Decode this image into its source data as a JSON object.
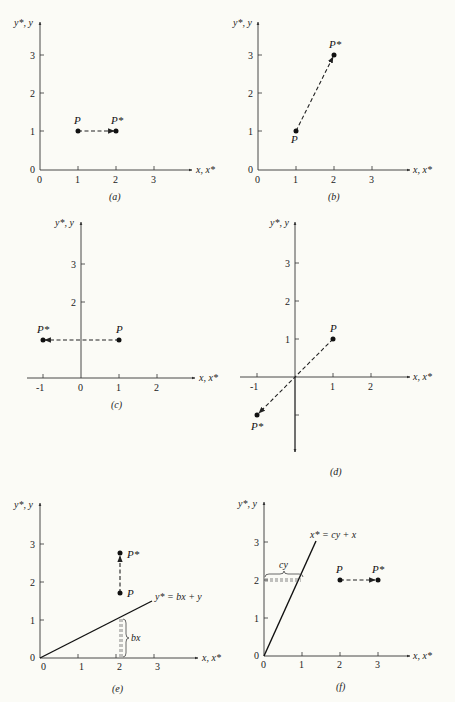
{
  "figure": {
    "panels": [
      {
        "id": "a",
        "caption": "(a)",
        "x_axis_label": "x, x*",
        "y_axis_label": "y*, y",
        "x_ticks": [
          "0",
          "1",
          "2",
          "3"
        ],
        "y_ticks": [
          "0",
          "1",
          "2",
          "3"
        ],
        "P": [
          1,
          1
        ],
        "P_star": [
          2,
          1
        ],
        "P_label": "P",
        "P_star_label": "P*"
      },
      {
        "id": "b",
        "caption": "(b)",
        "x_axis_label": "x, x*",
        "y_axis_label": "y*, y",
        "x_ticks": [
          "0",
          "1",
          "2",
          "3"
        ],
        "y_ticks": [
          "0",
          "1",
          "2",
          "3"
        ],
        "P": [
          1,
          1
        ],
        "P_star": [
          2,
          3
        ],
        "P_label": "P",
        "P_star_label": "P*"
      },
      {
        "id": "c",
        "caption": "(c)",
        "x_axis_label": "x, x*",
        "y_axis_label": "y*, y",
        "x_ticks": [
          "-1",
          "0",
          "1",
          "2"
        ],
        "y_ticks": [
          "2",
          "3"
        ],
        "P": [
          1,
          1
        ],
        "P_star": [
          -1,
          1
        ],
        "P_label": "P",
        "P_star_label": "P*"
      },
      {
        "id": "d",
        "caption": "(d)",
        "x_axis_label": "x, x*",
        "y_axis_label": "y*, y",
        "x_ticks": [
          "-1",
          "1",
          "2"
        ],
        "y_ticks": [
          "1",
          "2",
          "3"
        ],
        "P": [
          1,
          1
        ],
        "P_star": [
          -1,
          -1
        ],
        "P_label": "P",
        "P_star_label": "P*"
      },
      {
        "id": "e",
        "caption": "(e)",
        "x_axis_label": "x, x*",
        "y_axis_label": "y*, y",
        "x_ticks": [
          "0",
          "1",
          "2",
          "3"
        ],
        "y_ticks": [
          "0",
          "1",
          "2",
          "3"
        ],
        "P": [
          2,
          1.6
        ],
        "P_star": [
          2,
          2.6
        ],
        "P_label": "P",
        "P_star_label": "P*",
        "line_label": "y* = bx + y",
        "brace_label": "bx"
      },
      {
        "id": "f",
        "caption": "(f)",
        "x_axis_label": "x, x*",
        "y_axis_label": "y*, y",
        "x_ticks": [
          "0",
          "1",
          "2",
          "3"
        ],
        "y_ticks": [
          "0",
          "1",
          "2",
          "3"
        ],
        "P": [
          2,
          2
        ],
        "P_star": [
          3,
          2
        ],
        "P_label": "P",
        "P_star_label": "P*",
        "line_label": "x* = cy + x",
        "brace_label": "cy"
      }
    ]
  }
}
